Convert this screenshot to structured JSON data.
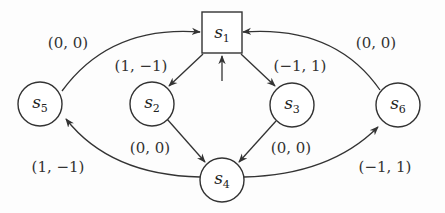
{
  "diagram": {
    "type": "state-transition-graph",
    "nodes": [
      {
        "id": "s1",
        "base": "s",
        "sub": "1",
        "shape": "square",
        "initial": true
      },
      {
        "id": "s2",
        "base": "s",
        "sub": "2",
        "shape": "circle"
      },
      {
        "id": "s3",
        "base": "s",
        "sub": "3",
        "shape": "circle"
      },
      {
        "id": "s4",
        "base": "s",
        "sub": "4",
        "shape": "circle"
      },
      {
        "id": "s5",
        "base": "s",
        "sub": "5",
        "shape": "circle"
      },
      {
        "id": "s6",
        "base": "s",
        "sub": "6",
        "shape": "circle"
      }
    ],
    "edges": [
      {
        "from": "s1",
        "to": "s2",
        "label": "(1, −1)"
      },
      {
        "from": "s1",
        "to": "s3",
        "label": "(−1, 1)"
      },
      {
        "from": "s2",
        "to": "s4",
        "label": "(0, 0)"
      },
      {
        "from": "s3",
        "to": "s4",
        "label": "(0, 0)"
      },
      {
        "from": "s4",
        "to": "s5",
        "label": "(1, −1)"
      },
      {
        "from": "s4",
        "to": "s6",
        "label": "(−1, 1)"
      },
      {
        "from": "s5",
        "to": "s1",
        "label": "(0, 0)"
      },
      {
        "from": "s6",
        "to": "s1",
        "label": "(0, 0)"
      }
    ]
  }
}
